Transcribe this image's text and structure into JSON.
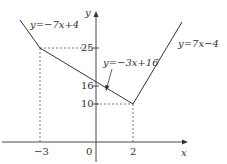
{
  "axes": {
    "x_label": "x",
    "y_label": "y"
  },
  "ticks": {
    "x": [
      "−3",
      "0",
      "2"
    ],
    "y": [
      "25",
      "16",
      "10"
    ]
  },
  "functions": [
    {
      "label": "y=−7x+4"
    },
    {
      "label": "y=−3x+16"
    },
    {
      "label": "y=7x−4"
    }
  ],
  "points": [
    {
      "x": -3,
      "y": 25
    },
    {
      "x": 2,
      "y": 10
    }
  ],
  "colors": {
    "line": "#333333",
    "dashed": "#555555"
  }
}
